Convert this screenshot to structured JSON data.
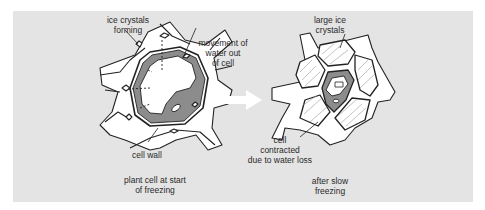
{
  "diagram": {
    "background": "#e4e4e4",
    "cell_fill": "#ffffff",
    "cytoplasm_fill": "#8c8c8c",
    "arrow_fill": "#ffffff",
    "left_panel": {
      "caption": "plant cell at start\nof freezing",
      "labels": {
        "ice_crystals": "ice crystals\nforming",
        "movement": "movement of\nwater out\nof cell",
        "cell_wall": "cell wall"
      }
    },
    "right_panel": {
      "caption": "after slow\nfreezing",
      "labels": {
        "large_ice": "large ice\ncrystals",
        "contracted": "cell\ncontracted\ndue to water loss"
      }
    }
  }
}
